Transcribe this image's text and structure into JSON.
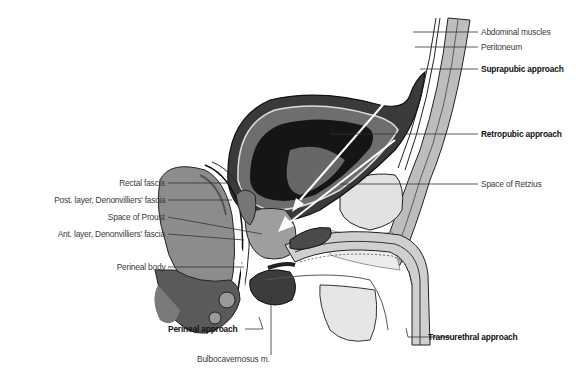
{
  "figure": {
    "colors": {
      "dark_tissue": "#1a1a1a",
      "mid_tissue": "#8a8a8a",
      "light_tissue": "#d6d6d6",
      "leader_line": "#333333",
      "arrow": "#ffffff"
    }
  },
  "labels": {
    "right": [
      {
        "id": "abdominal-muscles",
        "text": "Abdominal muscles",
        "bold": false
      },
      {
        "id": "peritoneum",
        "text": "Peritoneum",
        "bold": false
      },
      {
        "id": "suprapubic-approach",
        "text": "Suprapubic approach",
        "bold": true
      },
      {
        "id": "retropubic-approach",
        "text": "Retropubic approach",
        "bold": true
      },
      {
        "id": "space-of-retzius",
        "text": "Space of Retzius",
        "bold": false
      }
    ],
    "left": [
      {
        "id": "rectal-fascia",
        "text": "Rectal fascia",
        "bold": false
      },
      {
        "id": "post-layer-denonvilliers",
        "text": "Post. layer, Denonvilliers' fascia",
        "bold": false
      },
      {
        "id": "space-of-proust",
        "text": "Space of Proust",
        "bold": false
      },
      {
        "id": "ant-layer-denonvilliers",
        "text": "Ant. layer, Denonvilliers' fascia",
        "bold": false
      },
      {
        "id": "perineal-body",
        "text": "Perineal body",
        "bold": false
      }
    ],
    "bottom": [
      {
        "id": "perineal-approach",
        "text": "Perineal approach",
        "bold": true
      },
      {
        "id": "bulbocavernosus",
        "text": "Bulbocavernosus m.",
        "bold": false
      },
      {
        "id": "transurethral-approach",
        "text": "Transurethral approach",
        "bold": true
      }
    ]
  }
}
